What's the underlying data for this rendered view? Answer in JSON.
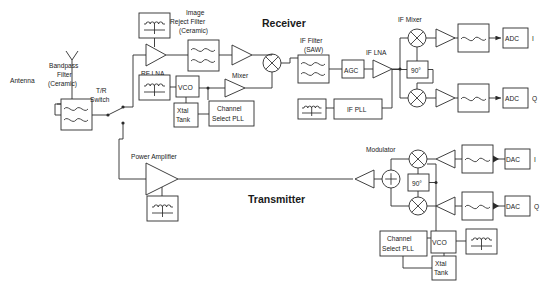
{
  "diagram": {
    "sections": {
      "receiver": "Receiver",
      "transmitter": "Transmitter"
    },
    "colors": {
      "line": "#2b2b2b",
      "text": "#1a1a1a",
      "background": "#ffffff"
    },
    "receiver_chain": {
      "antenna": "Antenna",
      "bandpass_filter": "Bandpass\nFilter\n(Ceramic)",
      "bandpass_filter_l1": "Bandpass",
      "bandpass_filter_l2": "Filter",
      "bandpass_filter_l3": "(Ceramic)",
      "tr_switch_l1": "T/R",
      "tr_switch_l2": "Switch",
      "rf_lna": "RF LNA",
      "image_reject_l1": "Image",
      "image_reject_l2": "Reject Filter",
      "image_reject_l3": "(Ceramic)",
      "mixer": "Mixer",
      "vco": "VCO",
      "xtal_tank_l1": "Xtal",
      "xtal_tank_l2": "Tank",
      "channel_pll_l1": "Channel",
      "channel_pll_l2": "Select PLL",
      "if_filter_l1": "IF Filter",
      "if_filter_l2": "(SAW)",
      "agc": "AGC",
      "if_lna": "IF LNA",
      "if_mixer": "IF Mixer",
      "phase_shift": "90°",
      "if_pll": "IF PLL",
      "adc_i": "ADC",
      "adc_i_suffix": "I",
      "adc_q": "ADC",
      "adc_q_suffix": "Q"
    },
    "transmitter_chain": {
      "power_amplifier": "Power Amplifier",
      "modulator": "Modulator",
      "phase_shift": "90°",
      "vco": "VCO",
      "xtal_tank_l1": "Xtal",
      "xtal_tank_l2": "Tank",
      "channel_pll_l1": "Channel",
      "channel_pll_l2": "Select PLL",
      "dac_i": "DAC",
      "dac_i_suffix": "I",
      "dac_q": "DAC",
      "dac_q_suffix": "Q"
    },
    "symbols": {
      "bias_tee": "bias-network-inductor",
      "bandpass": "bandpass-filter-double-sine",
      "lowpass": "lowpass-filter-single-sine",
      "mixer": "mixer-circle-cross",
      "summer": "summer-circle-plus",
      "amplifier": "amplifier-triangle",
      "antenna": "antenna-dipole",
      "switch": "spdt-switch"
    }
  }
}
